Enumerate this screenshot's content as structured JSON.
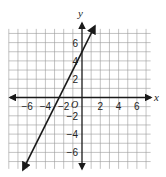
{
  "chart_data": {
    "type": "line",
    "title": "",
    "xlabel": "x",
    "ylabel": "y",
    "origin_label": "O",
    "xlim": [
      -8,
      7.5
    ],
    "ylim": [
      -7.8,
      8
    ],
    "grid": true,
    "grid_step": 1,
    "x_ticks": [
      -6,
      -4,
      -2,
      2,
      4,
      6
    ],
    "x_tick_labels": [
      "−6",
      "−4",
      "−2",
      "2",
      "4",
      "6"
    ],
    "y_ticks": [
      6,
      4,
      2,
      -2,
      -4,
      -6
    ],
    "y_tick_labels": [
      "6",
      "4",
      "2",
      "−2",
      "−4",
      "−6"
    ],
    "series": [
      {
        "name": "y = 2x + 5",
        "slope": 2,
        "intercept": 5,
        "x": [
          -6.45,
          1.4
        ],
        "y": [
          -7.9,
          7.8
        ],
        "arrows": "both"
      }
    ],
    "colors": {
      "line": "#1a1a1a",
      "grid": "#9a9a9a",
      "axis": "#1a1a1a",
      "background": "#ffffff"
    }
  }
}
